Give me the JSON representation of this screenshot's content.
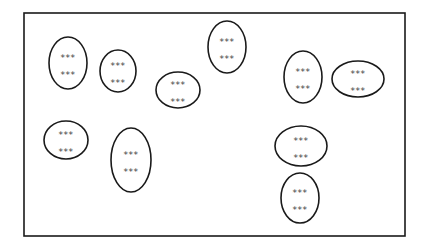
{
  "diagram": {
    "colors": {
      "stroke": "#1a1a1a",
      "text": "#444444",
      "background": "#ffffff"
    },
    "ovals": [
      {
        "id": 1,
        "line1": "***",
        "line2": "***"
      },
      {
        "id": 2,
        "line1": "***",
        "line2": "***"
      },
      {
        "id": 3,
        "line1": "***",
        "line2": "***"
      },
      {
        "id": 4,
        "line1": "***",
        "line2": "***"
      },
      {
        "id": 5,
        "line1": "***",
        "line2": "***"
      },
      {
        "id": 6,
        "line1": "***",
        "line2": "***"
      },
      {
        "id": 7,
        "line1": "***",
        "line2": "***"
      },
      {
        "id": 8,
        "line1": "***",
        "line2": "***"
      },
      {
        "id": 9,
        "line1": "***",
        "line2": "***"
      },
      {
        "id": 10,
        "line1": "***",
        "line2": "***"
      }
    ]
  }
}
